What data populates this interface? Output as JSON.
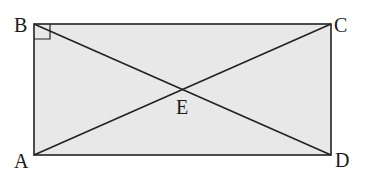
{
  "diagram": {
    "type": "rectangle-with-diagonals",
    "fill_color": "#e8e8e8",
    "stroke_color": "#222222",
    "points": {
      "A": {
        "label": "A",
        "x": 34,
        "y": 155
      },
      "B": {
        "label": "B",
        "x": 34,
        "y": 24
      },
      "C": {
        "label": "C",
        "x": 331,
        "y": 24
      },
      "D": {
        "label": "D",
        "x": 331,
        "y": 155
      },
      "E": {
        "label": "E",
        "x": 183,
        "y": 89
      }
    },
    "segments": [
      "AB",
      "BC",
      "CD",
      "DA",
      "AC",
      "BD"
    ],
    "right_angle_marker": "B"
  }
}
